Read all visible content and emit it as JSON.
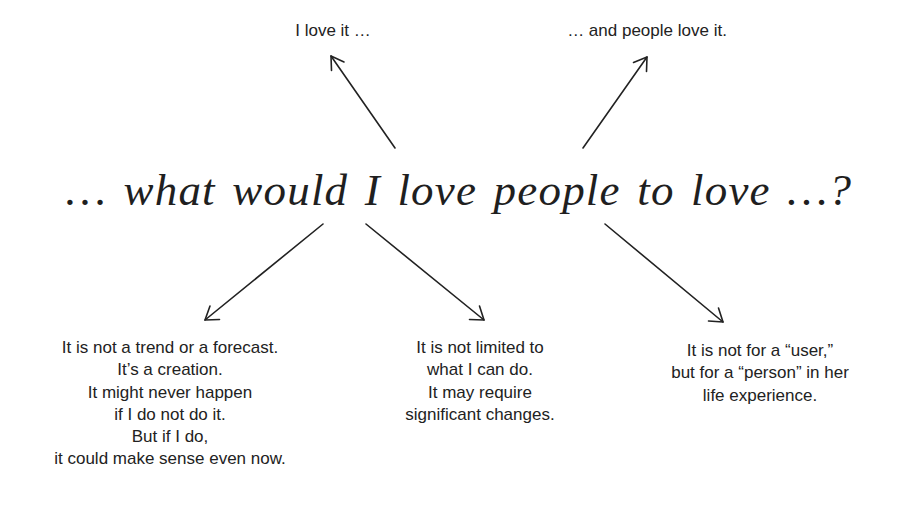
{
  "diagram": {
    "headline": "… what would I love people to love …?",
    "top_labels": {
      "left": "I love it …",
      "right": "… and people love it."
    },
    "notes": {
      "left": {
        "lines": [
          "It is not a trend or a forecast.",
          "It’s a creation.",
          "It might never happen",
          "if I do not do it.",
          "But if I do,",
          "it could make sense even now."
        ]
      },
      "middle": {
        "lines": [
          "It is not limited to",
          "what I can do.",
          "It may require",
          "significant changes."
        ]
      },
      "right": {
        "lines": [
          "It is not for a “user,”",
          "but for a “person” in her",
          "life experience."
        ]
      }
    },
    "arrows": [
      {
        "name": "arrow-to-i-love-it",
        "from": [
          395,
          148
        ],
        "to": [
          331,
          56
        ]
      },
      {
        "name": "arrow-to-people-love-it",
        "from": [
          583,
          148
        ],
        "to": [
          647,
          57
        ]
      },
      {
        "name": "arrow-to-left-note",
        "from": [
          323,
          224
        ],
        "to": [
          205,
          320
        ]
      },
      {
        "name": "arrow-to-middle-note",
        "from": [
          366,
          224
        ],
        "to": [
          484,
          320
        ]
      },
      {
        "name": "arrow-to-right-note",
        "from": [
          605,
          224
        ],
        "to": [
          723,
          322
        ]
      }
    ],
    "colors": {
      "background": "#ffffff",
      "ink": "#222222"
    }
  }
}
